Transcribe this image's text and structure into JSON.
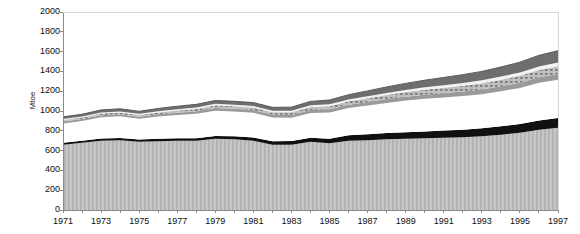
{
  "chart_data": {
    "type": "area",
    "title": "",
    "xlabel": "",
    "ylabel": "Mtoe",
    "ylim": [
      0,
      2000
    ],
    "ytick_values": [
      2000,
      1800,
      1600,
      1400,
      1200,
      1000,
      800,
      600,
      400,
      200,
      0
    ],
    "ytick_labels": [
      "2000",
      "1800",
      "1600",
      "1400",
      "1200",
      "1000",
      "800",
      "600",
      "400",
      "200",
      "0"
    ],
    "grid": false,
    "legend": "none",
    "stacked": true,
    "x": [
      1971,
      1972,
      1973,
      1974,
      1975,
      1976,
      1977,
      1978,
      1979,
      1980,
      1981,
      1982,
      1983,
      1984,
      1985,
      1986,
      1987,
      1988,
      1989,
      1990,
      1991,
      1992,
      1993,
      1994,
      1995,
      1996,
      1997
    ],
    "xtick_labels": [
      "1971",
      "1973",
      "1975",
      "1977",
      "1979",
      "1981",
      "1983",
      "1985",
      "1987",
      "1989",
      "1991",
      "1993",
      "1995",
      "1997"
    ],
    "xtick_values": [
      1971,
      1973,
      1975,
      1977,
      1979,
      1981,
      1983,
      1985,
      1987,
      1989,
      1991,
      1993,
      1995,
      1997
    ],
    "series": [
      {
        "name": "series-1-light-hatched",
        "color": "#c0c0c0",
        "pattern": "vertical-stripes",
        "values": [
          660,
          680,
          700,
          705,
          690,
          695,
          700,
          700,
          720,
          715,
          700,
          660,
          660,
          690,
          675,
          700,
          705,
          715,
          720,
          725,
          730,
          735,
          745,
          760,
          780,
          810,
          830
        ]
      },
      {
        "name": "series-2-black",
        "color": "#101010",
        "pattern": "solid",
        "values": [
          20,
          20,
          22,
          22,
          22,
          24,
          24,
          26,
          28,
          30,
          32,
          34,
          36,
          40,
          45,
          55,
          60,
          62,
          65,
          68,
          72,
          76,
          80,
          85,
          88,
          95,
          100
        ]
      },
      {
        "name": "series-3-gap",
        "color": "#ffffff",
        "pattern": "none",
        "values": [
          195,
          200,
          215,
          220,
          210,
          225,
          235,
          245,
          255,
          250,
          250,
          240,
          235,
          250,
          265,
          275,
          290,
          305,
          320,
          330,
          335,
          340,
          345,
          355,
          365,
          380,
          385
        ]
      },
      {
        "name": "series-4-midgray",
        "color": "#9a9a9a",
        "pattern": "solid",
        "values": [
          18,
          18,
          20,
          20,
          20,
          22,
          24,
          26,
          28,
          28,
          28,
          28,
          28,
          30,
          32,
          34,
          36,
          38,
          40,
          42,
          44,
          46,
          48,
          50,
          52,
          55,
          58
        ]
      },
      {
        "name": "series-5-light-grid",
        "color": "#b8b8b8",
        "pattern": "grid",
        "values": [
          16,
          16,
          18,
          18,
          18,
          20,
          22,
          24,
          26,
          26,
          26,
          26,
          28,
          30,
          32,
          34,
          38,
          42,
          46,
          50,
          54,
          58,
          62,
          66,
          70,
          74,
          78
        ]
      },
      {
        "name": "series-6-white-band",
        "color": "#f4f4f4",
        "pattern": "solid",
        "values": [
          10,
          10,
          11,
          11,
          11,
          12,
          13,
          14,
          15,
          15,
          15,
          15,
          16,
          17,
          18,
          19,
          20,
          21,
          22,
          24,
          26,
          28,
          30,
          32,
          34,
          36,
          38
        ]
      },
      {
        "name": "series-7-dark-top",
        "color": "#6e6e6e",
        "pattern": "solid",
        "values": [
          22,
          23,
          25,
          26,
          26,
          28,
          30,
          32,
          34,
          34,
          34,
          34,
          36,
          40,
          44,
          48,
          54,
          60,
          66,
          72,
          78,
          84,
          90,
          96,
          104,
          112,
          120
        ]
      }
    ],
    "totals": [
      941,
      967,
      1011,
      1022,
      997,
      1026,
      1048,
      1067,
      1106,
      1098,
      1085,
      1037,
      1039,
      1097,
      1111,
      1165,
      1203,
      1243,
      1279,
      1311,
      1339,
      1367,
      1400,
      1444,
      1493,
      1562,
      1609
    ]
  },
  "axes": {
    "ylabel": "Mtoe",
    "ytick_labels": [
      "2000",
      "1800",
      "1600",
      "1400",
      "1200",
      "1000",
      "800",
      "600",
      "400",
      "200",
      "0"
    ],
    "xtick_labels": [
      "1971",
      "1973",
      "1975",
      "1977",
      "1979",
      "1981",
      "1983",
      "1985",
      "1987",
      "1989",
      "1991",
      "1993",
      "1995",
      "1997"
    ]
  },
  "colors": {
    "axis": "#9a9a9a",
    "text": "#0d0d0d",
    "band_bottom": "#c0c0c0",
    "band_black": "#101010",
    "band_mid": "#9a9a9a",
    "band_grid": "#b8b8b8",
    "band_white": "#f4f4f4",
    "band_top": "#6e6e6e"
  }
}
